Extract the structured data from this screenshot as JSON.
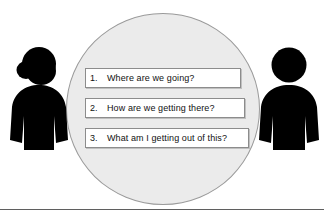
{
  "diagram": {
    "circle": {
      "name": "discussion-circle",
      "fill_color": "#ebebeb",
      "stroke_color": "#9a9a9a"
    },
    "questions": [
      {
        "number": "1.",
        "text": "Where are we going?"
      },
      {
        "number": "2.",
        "text": "How are we getting there?"
      },
      {
        "number": "3.",
        "text": "What am I getting out of this?"
      }
    ],
    "figures": [
      {
        "name": "person-left",
        "icon": "person-with-ponytail-icon",
        "color": "#000000"
      },
      {
        "name": "person-right",
        "icon": "person-icon",
        "color": "#000000"
      }
    ],
    "divider": {
      "name": "bottom-rule",
      "color": "#5f5f5f"
    }
  }
}
